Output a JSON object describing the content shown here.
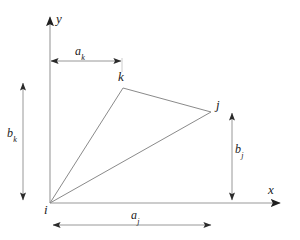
{
  "figure": {
    "type": "geometry-diagram",
    "background_color": "#ffffff",
    "line_color": "#808080",
    "axis_color": "#9a9a9a",
    "dimension_color": "#8c8c8c",
    "text_color": "#1a1a1a"
  },
  "axes": {
    "x_label": "x",
    "y_label": "y",
    "origin": {
      "x": 50,
      "y": 203
    },
    "x_axis_end": {
      "x": 286,
      "y": 203
    },
    "y_axis_end": {
      "x": 50,
      "y": 12
    }
  },
  "vertices": [
    {
      "name": "i",
      "label": "i",
      "x": 50,
      "y": 203
    },
    {
      "name": "k",
      "label": "k",
      "x": 123,
      "y": 88
    },
    {
      "name": "j",
      "label": "j",
      "x": 211,
      "y": 112
    }
  ],
  "edges": [
    {
      "name": "edge-i-k",
      "from": "i",
      "to": "k"
    },
    {
      "name": "edge-k-j",
      "from": "k",
      "to": "j"
    },
    {
      "name": "edge-i-j",
      "from": "i",
      "to": "j"
    }
  ],
  "dimensions": [
    {
      "name": "a_k",
      "base": "a",
      "subscript": "k",
      "orientation": "horizontal",
      "from": {
        "x": 51,
        "y": 61
      },
      "to": {
        "x": 122,
        "y": 61
      },
      "measures": "horizontal distance from i to k"
    },
    {
      "name": "b_k",
      "base": "b",
      "subscript": "k",
      "orientation": "vertical",
      "from": {
        "x": 23,
        "y": 82
      },
      "to": {
        "x": 23,
        "y": 201
      },
      "measures": "vertical distance from i to k"
    },
    {
      "name": "a_j",
      "base": "a",
      "subscript": "j",
      "orientation": "horizontal",
      "from": {
        "x": 52,
        "y": 225
      },
      "to": {
        "x": 212,
        "y": 225
      },
      "measures": "horizontal distance from i to j"
    },
    {
      "name": "b_j",
      "base": "b",
      "subscript": "j",
      "orientation": "vertical",
      "from": {
        "x": 232,
        "y": 112
      },
      "to": {
        "x": 232,
        "y": 201
      },
      "measures": "vertical distance from i to j"
    }
  ],
  "extension_lines": [
    {
      "name": "ext-k-vertical",
      "from": {
        "x": 122,
        "y": 55
      },
      "to": {
        "x": 122,
        "y": 70
      }
    }
  ]
}
